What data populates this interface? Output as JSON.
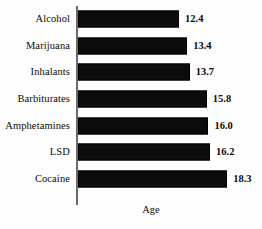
{
  "chart": {
    "background_color": "#fdfdfd",
    "bar_color": "#0c0c0c",
    "axis_color": "#6a6a6a",
    "text_color": "#0a0a0a"
  },
  "chart_data": {
    "type": "bar",
    "orientation": "horizontal",
    "title": "",
    "subtitle": "",
    "xlabel": "Age",
    "ylabel": "",
    "categories": [
      "Alcohol",
      "Marijuana",
      "Inhalants",
      "Barbiturates",
      "Amphetamines",
      "LSD",
      "Cocaine"
    ],
    "values": [
      12.4,
      13.4,
      13.7,
      15.8,
      16.0,
      16.2,
      18.3
    ],
    "value_labels": [
      "12.4",
      "13.4",
      "13.7",
      "15.8",
      "16.0",
      "16.2",
      "18.3"
    ],
    "xlim": [
      0,
      20
    ],
    "grid": false,
    "legend": null,
    "tick_labels": [],
    "annotations": []
  }
}
